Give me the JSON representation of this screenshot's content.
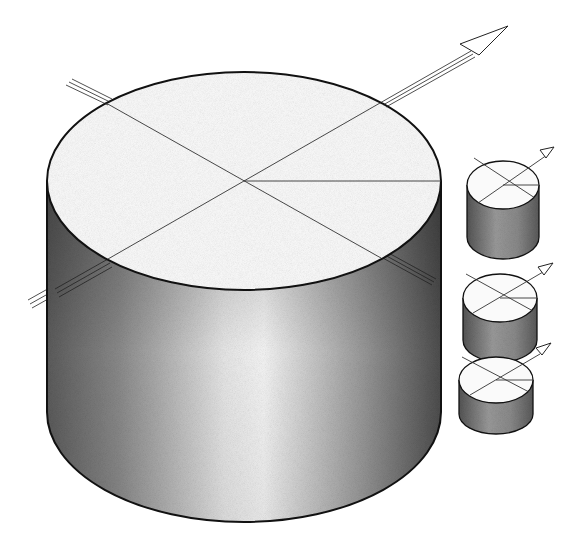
{
  "figure": {
    "background": "#ffffff",
    "stroke_color": "#111111",
    "shade_dark": "#6a6a6a",
    "shade_light": "#f4f4f4"
  },
  "large_cylinder": {
    "top_ellipse": {
      "cx": 244,
      "cy": 181,
      "rx": 197,
      "ry": 109
    },
    "bottom_y": 412,
    "has_axis_arrow": true,
    "axis_style": "triple-line"
  },
  "small_cylinders": [
    {
      "name": "small-cylinder-1",
      "cx": 503,
      "top_cy": 185,
      "rx": 36,
      "ry": 24,
      "height": 52
    },
    {
      "name": "small-cylinder-2",
      "cx": 500,
      "top_cy": 298,
      "rx": 37,
      "ry": 24,
      "height": 42
    },
    {
      "name": "small-cylinder-3",
      "cx": 496,
      "top_cy": 380,
      "rx": 37,
      "ry": 23,
      "height": 34
    }
  ]
}
